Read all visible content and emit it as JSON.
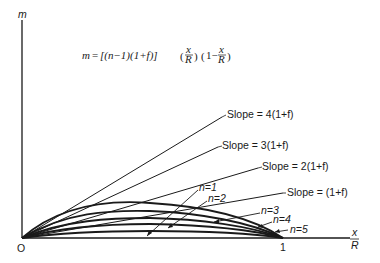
{
  "diagram": {
    "y_axis_label": "m",
    "origin_label": "O",
    "x_tick_label": "1",
    "x_axis_label_num": "x",
    "x_axis_label_den": "R",
    "equation": {
      "lhs": "m",
      "bracket": "[(n−1)(1+f)]",
      "frac1_num": "x",
      "frac1_den": "R",
      "factor2_prefix": "1−",
      "frac2_num": "x",
      "frac2_den": "R"
    },
    "slope_lines": [
      {
        "label": "Slope = 4(1+f)",
        "slope_factor": 4
      },
      {
        "label": "Slope = 3(1+f)",
        "slope_factor": 3
      },
      {
        "label": "Slope = 2(1+f)",
        "slope_factor": 2
      },
      {
        "label": "Slope = (1+f)",
        "slope_factor": 1
      }
    ],
    "curves": [
      {
        "label": "n=1"
      },
      {
        "label": "n=2"
      },
      {
        "label": "n=3"
      },
      {
        "label": "n=4"
      },
      {
        "label": "n=5"
      }
    ],
    "colors": {
      "ink": "#1a1a1a",
      "background": "#ffffff"
    }
  }
}
